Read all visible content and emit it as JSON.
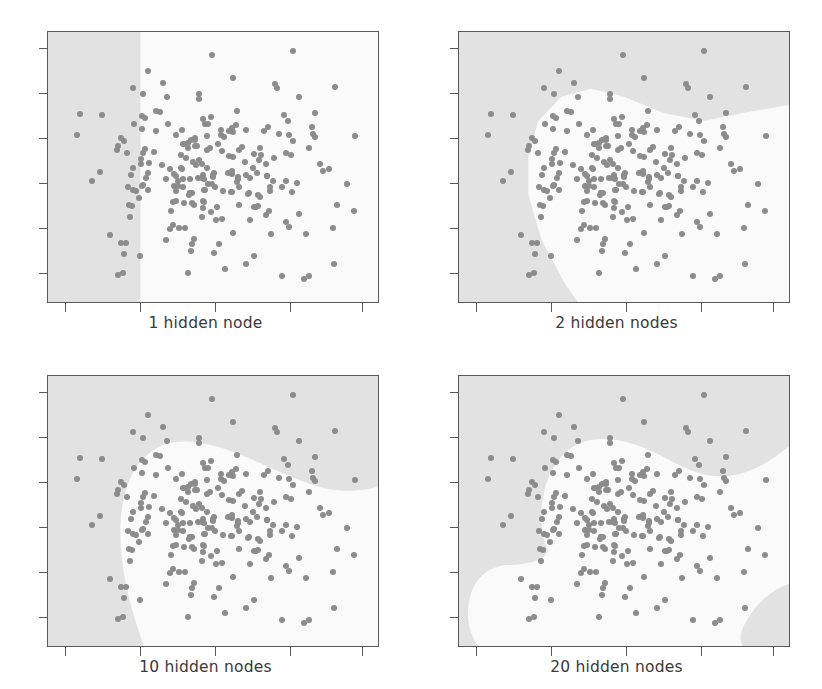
{
  "figure": {
    "width": 822,
    "height": 689,
    "background": "#ffffff",
    "layout": "2x2 grid of decision-boundary scatter plots"
  },
  "style": {
    "point_color": "#8c8c8c",
    "frame_color": "#5a5a5a",
    "region_class_a_color": "#e2e2e2",
    "region_class_b_color": "#fafafa",
    "caption_color": "#3a3a3a",
    "point_radius_px": 3
  },
  "chart_data": {
    "type": "scatter",
    "title": "",
    "xlabel": "",
    "ylabel": "",
    "grid": false,
    "legend": "none",
    "axis": {
      "xlim": [
        0,
        1
      ],
      "ylim": [
        0,
        1
      ],
      "x_tick_count": 5,
      "y_tick_count": 6,
      "x_tick_labels": [
        "",
        "",
        "",
        "",
        ""
      ],
      "y_tick_labels": [
        "",
        "",
        "",
        "",
        "",
        ""
      ]
    },
    "panels": [
      {
        "id": "panel-1",
        "caption": "1 hidden node",
        "hidden_nodes": 1,
        "boundary_description": "single vertical linear boundary near x=0.28",
        "regions": [
          {
            "class": "A",
            "shade": "#e2e2e2",
            "path": "M0,0 L28,0 L28,100 L0,100 Z"
          },
          {
            "class": "B",
            "shade": "#fafafa",
            "path": "M28,0 L100,0 L100,100 L28,100 Z"
          }
        ]
      },
      {
        "id": "panel-2",
        "caption": "2 hidden nodes",
        "hidden_nodes": 2,
        "boundary_description": "two linear cuts forming a wedge opening to lower-right",
        "regions": [
          {
            "class": "A",
            "shade": "#e2e2e2",
            "path": "M0,0 L100,0 L100,28 L74,33 L62,30 L44,22 L30,25 L22,38 L21,60 L26,78 L34,95 L38,100 L0,100 Z"
          },
          {
            "class": "B",
            "shade": "#fafafa",
            "path": "M100,28 L100,100 L38,100 L34,95 L26,78 L21,60 L22,38 L30,25 L44,22 L62,30 L74,33 Z"
          }
        ]
      },
      {
        "id": "panel-3",
        "caption": "10 hidden nodes",
        "hidden_nodes": 10,
        "boundary_description": "curved boundary arching over the central cluster, dipping to lower-left",
        "regions": [
          {
            "class": "A",
            "shade": "#e2e2e2",
            "path": "M0,0 L100,0 L100,43 L86,41 L72,39 L58,30 L44,24 L33,26 L26,36 L23,55 L24,74 L28,92 L30,100 L0,100 Z"
          },
          {
            "class": "B",
            "shade": "#fafafa",
            "path": "M100,43 L100,100 L30,100 L28,92 L24,74 L23,55 L26,36 L33,26 L44,24 L58,30 L72,39 L86,41 Z"
          }
        ]
      },
      {
        "id": "panel-4",
        "caption": "20 hidden nodes",
        "hidden_nodes": 20,
        "boundary_description": "complex multi-lobed boundary with an isolated gray blob in the lower-right corner and a gray lobe at lower-left",
        "regions": [
          {
            "class": "A",
            "shade": "#e2e2e2",
            "path": "M0,0 L100,0 L100,28 L92,34 L82,38 L72,36 L64,30 L56,26 L46,24 L38,27 L32,34 L29,46 L28,57 L30,66 L28,72 L22,74 L14,73 L8,77 L6,86 L9,96 L12,100 L0,100 Z"
          },
          {
            "class": "A2",
            "shade": "#e2e2e2",
            "path": "M100,78 L96,80 L90,86 L87,94 L88,100 L100,100 Z"
          },
          {
            "class": "B",
            "shade": "#fafafa",
            "path": "remainder"
          }
        ]
      }
    ],
    "points_per_panel": 230,
    "points_note": "identical scatter sample drawn in all four panels"
  },
  "captions": {
    "panel1": "1 hidden node",
    "panel2": "2 hidden nodes",
    "panel3": "10 hidden nodes",
    "panel4": "20 hidden nodes"
  }
}
